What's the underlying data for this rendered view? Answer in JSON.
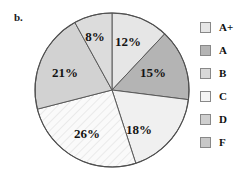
{
  "panel": {
    "label": "b."
  },
  "chart_data": {
    "type": "pie",
    "title": "",
    "subtitle": "",
    "xlabel": "",
    "ylabel": "",
    "grid": false,
    "legend_position": "right",
    "start_angle_deg": 0,
    "direction": "clockwise",
    "categories": [
      "A+",
      "A",
      "B",
      "C",
      "D",
      "F"
    ],
    "values": [
      12,
      15,
      18,
      26,
      21,
      8
    ],
    "value_labels": [
      "12%",
      "15%",
      "18%",
      "26%",
      "21%",
      "8%"
    ],
    "units": "percent",
    "total": 100,
    "slices": [
      {
        "category": "A+",
        "value": 12,
        "label": "12%",
        "color": "#e6e6e6",
        "pattern": "solid",
        "label_x": 95,
        "label_y": 32
      },
      {
        "category": "A",
        "value": 15,
        "label": "15%",
        "color": "#b4b4b4",
        "pattern": "solid",
        "label_x": 120,
        "label_y": 63
      },
      {
        "category": "B",
        "value": 18,
        "label": "18%",
        "color": "#f0f0f0",
        "pattern": "solid",
        "label_x": 106,
        "label_y": 120
      },
      {
        "category": "C",
        "value": 26,
        "label": "26%",
        "color": "#fafafa",
        "pattern": "diagonal-hatch",
        "label_x": 54,
        "label_y": 124
      },
      {
        "category": "D",
        "value": 21,
        "label": "21%",
        "color": "#d2d2d2",
        "pattern": "solid",
        "label_x": 32,
        "label_y": 63
      },
      {
        "category": "F",
        "value": 8,
        "label": "8%",
        "color": "#dcdcdc",
        "pattern": "solid",
        "label_x": 62,
        "label_y": 27
      }
    ],
    "legend": [
      {
        "label": "A+",
        "color": "#e6e6e6",
        "pattern": "solid"
      },
      {
        "label": "A",
        "color": "#b4b4b4",
        "pattern": "solid"
      },
      {
        "label": "B",
        "color": "#d8d8d8",
        "pattern": "solid"
      },
      {
        "label": "C",
        "color": "#f4f4f4",
        "pattern": "solid"
      },
      {
        "label": "D",
        "color": "#cfcfcf",
        "pattern": "solid"
      },
      {
        "label": "F",
        "color": "#c8c8c8",
        "pattern": "solid"
      }
    ]
  }
}
